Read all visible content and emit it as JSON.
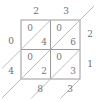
{
  "figure": {
    "grid": {
      "rows": 2,
      "cols": 2,
      "x0": 21,
      "y0": 20,
      "cell": 29.5
    },
    "colors": {
      "line": "#9a9a9a",
      "diagonal": "#b4b4b4",
      "text": "#6f6f6f",
      "background": "#ffffff"
    }
  },
  "top_labels": [
    {
      "name": "top-label-col-1",
      "value": "2",
      "x": 36,
      "y": 12
    },
    {
      "name": "top-label-col-2",
      "value": "3",
      "x": 66,
      "y": 12
    }
  ],
  "right_labels": [
    {
      "name": "right-label-row-1",
      "value": "2",
      "x": 90,
      "y": 35
    },
    {
      "name": "right-label-row-2",
      "value": "1",
      "x": 90,
      "y": 65
    }
  ],
  "left_results": [
    {
      "name": "left-result-row-1",
      "value": "0",
      "x": 11,
      "y": 42
    },
    {
      "name": "left-result-row-2",
      "value": "4",
      "x": 11,
      "y": 72
    }
  ],
  "bottom_results": [
    {
      "name": "bottom-result-col-1",
      "value": "8",
      "x": 40,
      "y": 90
    },
    {
      "name": "bottom-result-col-2",
      "value": "3",
      "x": 70,
      "y": 90
    }
  ],
  "cells": [
    {
      "name": "lattice-cell-r1c1",
      "row": 1,
      "col": 1,
      "tens": "0",
      "ones": "4",
      "tens_x": 30,
      "tens_y": 29,
      "ones_x": 44,
      "ones_y": 43
    },
    {
      "name": "lattice-cell-r1c2",
      "row": 1,
      "col": 2,
      "tens": "0",
      "ones": "6",
      "tens_x": 59,
      "tens_y": 29,
      "ones_x": 73,
      "ones_y": 43
    },
    {
      "name": "lattice-cell-r2c1",
      "row": 2,
      "col": 1,
      "tens": "0",
      "ones": "2",
      "tens_x": 30,
      "tens_y": 58,
      "ones_x": 44,
      "ones_y": 72
    },
    {
      "name": "lattice-cell-r2c2",
      "row": 2,
      "col": 2,
      "tens": "0",
      "ones": "3",
      "tens_x": 59,
      "tens_y": 58,
      "ones_x": 73,
      "ones_y": 72
    }
  ]
}
